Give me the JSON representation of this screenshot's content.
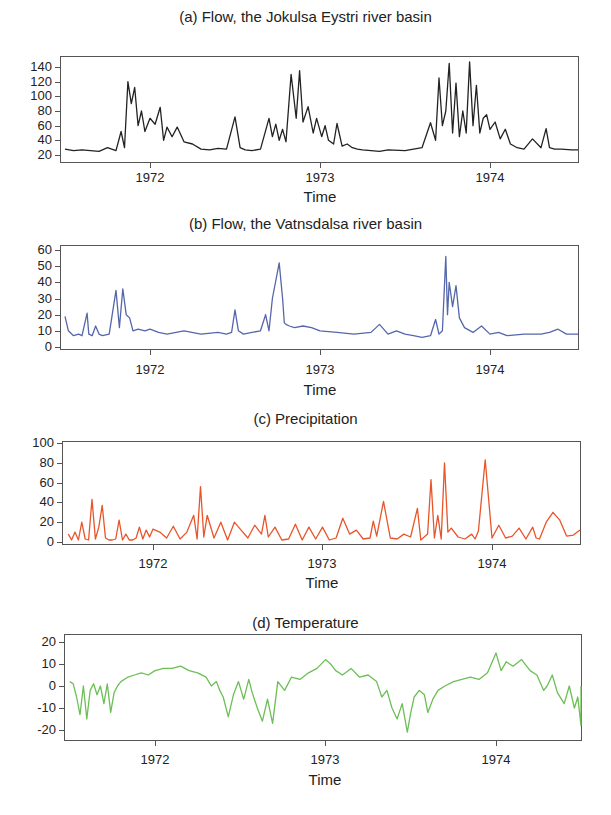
{
  "chart_data": [
    {
      "type": "line",
      "title": "(a) Flow, the Jokulsa Eystri river basin",
      "xlabel": "Time",
      "ylabel": "",
      "color": "#222222",
      "xticks": [
        "1972",
        "1973",
        "1974"
      ],
      "yticks": [
        "20",
        "40",
        "60",
        "80",
        "100",
        "120",
        "140"
      ],
      "ylim": [
        20,
        140
      ],
      "xlim": [
        1971.47,
        1974.52
      ],
      "x": [
        1971.5,
        1971.55,
        1971.6,
        1971.65,
        1971.7,
        1971.75,
        1971.8,
        1971.83,
        1971.85,
        1971.87,
        1971.89,
        1971.91,
        1971.93,
        1971.95,
        1971.97,
        1972.0,
        1972.03,
        1972.06,
        1972.08,
        1972.1,
        1972.13,
        1972.16,
        1972.2,
        1972.25,
        1972.3,
        1972.35,
        1972.4,
        1972.45,
        1972.5,
        1972.53,
        1972.56,
        1972.6,
        1972.65,
        1972.7,
        1972.72,
        1972.74,
        1972.76,
        1972.78,
        1972.8,
        1972.83,
        1972.86,
        1972.88,
        1972.9,
        1972.93,
        1972.96,
        1972.98,
        1973.01,
        1973.03,
        1973.05,
        1973.08,
        1973.1,
        1973.13,
        1973.16,
        1973.19,
        1973.22,
        1973.25,
        1973.3,
        1973.35,
        1973.4,
        1973.5,
        1973.6,
        1973.65,
        1973.68,
        1973.7,
        1973.72,
        1973.74,
        1973.76,
        1973.78,
        1973.8,
        1973.82,
        1973.84,
        1973.86,
        1973.88,
        1973.9,
        1973.92,
        1973.94,
        1973.96,
        1973.98,
        1974.0,
        1974.03,
        1974.06,
        1974.09,
        1974.12,
        1974.16,
        1974.2,
        1974.25,
        1974.3,
        1974.33,
        1974.35,
        1974.38,
        1974.42,
        1974.48,
        1974.52
      ],
      "values": [
        28,
        26,
        27,
        26,
        25,
        30,
        26,
        52,
        30,
        120,
        90,
        112,
        60,
        80,
        52,
        70,
        62,
        85,
        40,
        58,
        45,
        58,
        38,
        35,
        28,
        27,
        29,
        28,
        72,
        30,
        27,
        26,
        28,
        70,
        45,
        62,
        40,
        55,
        38,
        130,
        70,
        135,
        65,
        86,
        50,
        70,
        45,
        60,
        40,
        35,
        63,
        32,
        35,
        30,
        28,
        27,
        26,
        25,
        27,
        26,
        30,
        64,
        40,
        125,
        60,
        80,
        145,
        50,
        118,
        45,
        80,
        50,
        147,
        60,
        115,
        50,
        70,
        75,
        55,
        65,
        42,
        55,
        35,
        30,
        28,
        42,
        30,
        56,
        30,
        28,
        28,
        27,
        27
      ]
    },
    {
      "type": "line",
      "title": "(b) Flow, the Vatnsdalsa river basin",
      "xlabel": "Time",
      "ylabel": "",
      "color": "#5566aa",
      "xticks": [
        "1972",
        "1973",
        "1974"
      ],
      "yticks": [
        "0",
        "10",
        "20",
        "30",
        "40",
        "50",
        "60"
      ],
      "ylim": [
        0,
        60
      ],
      "xlim": [
        1971.47,
        1974.52
      ],
      "x": [
        1971.5,
        1971.52,
        1971.55,
        1971.58,
        1971.6,
        1971.63,
        1971.64,
        1971.66,
        1971.68,
        1971.7,
        1971.72,
        1971.76,
        1971.8,
        1971.82,
        1971.84,
        1971.86,
        1971.88,
        1971.9,
        1971.93,
        1971.97,
        1972.0,
        1972.05,
        1972.1,
        1972.2,
        1972.3,
        1972.4,
        1972.45,
        1972.48,
        1972.5,
        1972.52,
        1972.55,
        1972.6,
        1972.65,
        1972.68,
        1972.7,
        1972.72,
        1972.76,
        1972.78,
        1972.79,
        1972.8,
        1972.82,
        1972.85,
        1972.9,
        1972.95,
        1973.0,
        1973.1,
        1973.2,
        1973.3,
        1973.35,
        1973.4,
        1973.45,
        1973.5,
        1973.55,
        1973.6,
        1973.65,
        1973.68,
        1973.7,
        1973.72,
        1973.74,
        1973.75,
        1973.76,
        1973.78,
        1973.8,
        1973.82,
        1973.85,
        1973.9,
        1973.95,
        1974.0,
        1974.05,
        1974.1,
        1974.2,
        1974.3,
        1974.35,
        1974.4,
        1974.45,
        1974.52
      ],
      "values": [
        19,
        10,
        7,
        8,
        7,
        21,
        8,
        7,
        13,
        8,
        7,
        8,
        35,
        12,
        36,
        20,
        18,
        10,
        11,
        10,
        11,
        9,
        8,
        10,
        8,
        9,
        8,
        9,
        23,
        10,
        8,
        9,
        10,
        20,
        10,
        30,
        52,
        30,
        15,
        14,
        13,
        12,
        13,
        12,
        10,
        9,
        8,
        9,
        14,
        8,
        10,
        8,
        7,
        6,
        7,
        17,
        8,
        10,
        56,
        20,
        40,
        25,
        38,
        18,
        12,
        9,
        13,
        8,
        9,
        7,
        8,
        8,
        9,
        11,
        8,
        8
      ]
    },
    {
      "type": "line",
      "title": "(c) Precipitation",
      "xlabel": "Time",
      "ylabel": "",
      "color": "#e8552a",
      "xticks": [
        "1972",
        "1973",
        "1974"
      ],
      "yticks": [
        "0",
        "20",
        "40",
        "60",
        "80",
        "100"
      ],
      "ylim": [
        0,
        100
      ],
      "xlim": [
        1971.47,
        1974.52
      ],
      "x": [
        1971.5,
        1971.52,
        1971.54,
        1971.56,
        1971.58,
        1971.6,
        1971.62,
        1971.64,
        1971.66,
        1971.68,
        1971.7,
        1971.72,
        1971.74,
        1971.76,
        1971.78,
        1971.8,
        1971.82,
        1971.84,
        1971.86,
        1971.88,
        1971.9,
        1971.92,
        1971.94,
        1971.96,
        1971.98,
        1972.0,
        1972.04,
        1972.08,
        1972.12,
        1972.16,
        1972.2,
        1972.24,
        1972.26,
        1972.28,
        1972.3,
        1972.32,
        1972.36,
        1972.4,
        1972.44,
        1972.48,
        1972.52,
        1972.56,
        1972.6,
        1972.64,
        1972.66,
        1972.68,
        1972.72,
        1972.76,
        1972.8,
        1972.84,
        1972.88,
        1972.92,
        1972.96,
        1973.0,
        1973.04,
        1973.08,
        1973.12,
        1973.16,
        1973.2,
        1973.24,
        1973.28,
        1973.3,
        1973.32,
        1973.36,
        1973.4,
        1973.44,
        1973.48,
        1973.52,
        1973.56,
        1973.58,
        1973.6,
        1973.62,
        1973.64,
        1973.66,
        1973.68,
        1973.7,
        1973.72,
        1973.74,
        1973.76,
        1973.8,
        1973.84,
        1973.88,
        1973.9,
        1973.92,
        1973.96,
        1974.0,
        1974.04,
        1974.08,
        1974.12,
        1974.16,
        1974.2,
        1974.24,
        1974.26,
        1974.28,
        1974.32,
        1974.36,
        1974.4,
        1974.44,
        1974.48,
        1974.52
      ],
      "values": [
        8,
        2,
        10,
        2,
        20,
        3,
        2,
        43,
        3,
        15,
        37,
        4,
        2,
        2,
        3,
        22,
        2,
        8,
        2,
        2,
        4,
        15,
        3,
        12,
        5,
        13,
        10,
        4,
        16,
        3,
        10,
        27,
        3,
        56,
        5,
        27,
        4,
        20,
        2,
        20,
        12,
        4,
        17,
        8,
        27,
        5,
        15,
        2,
        3,
        18,
        2,
        15,
        3,
        15,
        2,
        4,
        24,
        8,
        12,
        3,
        4,
        21,
        6,
        41,
        4,
        3,
        8,
        5,
        34,
        2,
        5,
        8,
        63,
        4,
        27,
        3,
        80,
        10,
        14,
        5,
        3,
        8,
        3,
        11,
        83,
        4,
        17,
        4,
        6,
        14,
        3,
        15,
        4,
        3,
        20,
        30,
        22,
        6,
        7,
        12
      ]
    },
    {
      "type": "line",
      "title": "(d)  Temperature",
      "xlabel": "Time",
      "ylabel": "",
      "color": "#6cbf55",
      "xticks": [
        "1972",
        "1973",
        "1974"
      ],
      "yticks": [
        "-20",
        "-10",
        "0",
        "10",
        "20"
      ],
      "ylim": [
        -20,
        20
      ],
      "xlim": [
        1971.47,
        1974.52
      ],
      "x": [
        1971.5,
        1971.52,
        1971.54,
        1971.56,
        1971.58,
        1971.6,
        1971.62,
        1971.64,
        1971.66,
        1971.68,
        1971.7,
        1971.72,
        1971.74,
        1971.76,
        1971.78,
        1971.8,
        1971.84,
        1971.88,
        1971.92,
        1971.96,
        1972.0,
        1972.05,
        1972.1,
        1972.15,
        1972.2,
        1972.25,
        1972.3,
        1972.33,
        1972.36,
        1972.38,
        1972.4,
        1972.43,
        1972.46,
        1972.49,
        1972.52,
        1972.55,
        1972.57,
        1972.6,
        1972.63,
        1972.66,
        1972.69,
        1972.72,
        1972.76,
        1972.8,
        1972.85,
        1972.9,
        1972.95,
        1973.0,
        1973.03,
        1973.06,
        1973.1,
        1973.15,
        1973.2,
        1973.25,
        1973.3,
        1973.33,
        1973.36,
        1973.39,
        1973.42,
        1973.45,
        1973.48,
        1973.5,
        1973.52,
        1973.55,
        1973.58,
        1973.6,
        1973.63,
        1973.66,
        1973.7,
        1973.75,
        1973.8,
        1973.85,
        1973.9,
        1973.95,
        1974.0,
        1974.03,
        1974.06,
        1974.1,
        1974.15,
        1974.2,
        1974.24,
        1974.28,
        1974.3,
        1974.33,
        1974.36,
        1974.4,
        1974.43,
        1974.46,
        1974.48,
        1974.5,
        1974.52
      ],
      "values": [
        2,
        1,
        -5,
        -13,
        0,
        -15,
        -2,
        1,
        -4,
        0,
        -8,
        1,
        -12,
        -3,
        0,
        2,
        4,
        5,
        6,
        5,
        7,
        8,
        8,
        9,
        7,
        6,
        4,
        0,
        2,
        -2,
        -5,
        -14,
        -4,
        2,
        -6,
        3,
        -3,
        -10,
        -16,
        -6,
        -17,
        2,
        -2,
        4,
        3,
        6,
        8,
        12,
        10,
        7,
        5,
        8,
        4,
        5,
        2,
        -5,
        -2,
        -10,
        -15,
        -8,
        -21,
        -12,
        -5,
        -2,
        -4,
        -12,
        -6,
        -2,
        0,
        2,
        3,
        4,
        3,
        6,
        15,
        7,
        11,
        9,
        12,
        7,
        5,
        -2,
        0,
        5,
        -3,
        -8,
        0,
        -10,
        -5,
        -18,
        0
      ]
    }
  ]
}
